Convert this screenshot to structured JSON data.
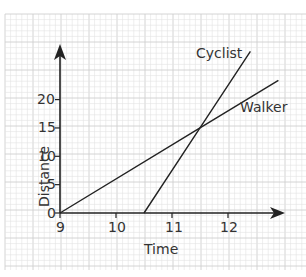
{
  "chart_data": {
    "type": "line",
    "title": "",
    "xlabel": "Time",
    "ylabel": "Distance",
    "x_ticks": [
      "9",
      "10",
      "11",
      "12"
    ],
    "y_ticks": [
      "0",
      "5",
      "10",
      "15",
      "20"
    ],
    "xlim": [
      9,
      13
    ],
    "ylim": [
      0,
      30
    ],
    "grid": true,
    "series": [
      {
        "name": "Walker",
        "x": [
          9,
          11.5,
          12.9
        ],
        "y": [
          0,
          15,
          23.4
        ]
      },
      {
        "name": "Cyclist",
        "x": [
          10.5,
          11.5,
          12.4
        ],
        "y": [
          0,
          15,
          28.5
        ]
      }
    ],
    "annotations": [
      "Cyclist",
      "Walker"
    ],
    "intersection": {
      "x": 11.5,
      "y": 15
    }
  },
  "colors": {
    "grid_minor": "#e2e2e2",
    "grid_major": "#cfcfcf",
    "line": "#222222",
    "text": "#333333"
  }
}
